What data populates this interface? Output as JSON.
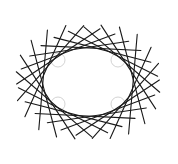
{
  "figure": {
    "type": "tangent-line envelope",
    "ellipse": {
      "cx": 88,
      "cy": 82,
      "rx": 45,
      "ry": 34
    },
    "line_count": 24,
    "half_length": 50,
    "line_color": "#1a1a1a",
    "ghost_arc_color": "#c8c8c8",
    "ghost_arcs": [
      {
        "cx": 118,
        "cy": 60,
        "r": 7
      },
      {
        "cx": 58,
        "cy": 60,
        "r": 7
      },
      {
        "cx": 58,
        "cy": 104,
        "r": 7
      },
      {
        "cx": 118,
        "cy": 104,
        "r": 7
      }
    ]
  }
}
